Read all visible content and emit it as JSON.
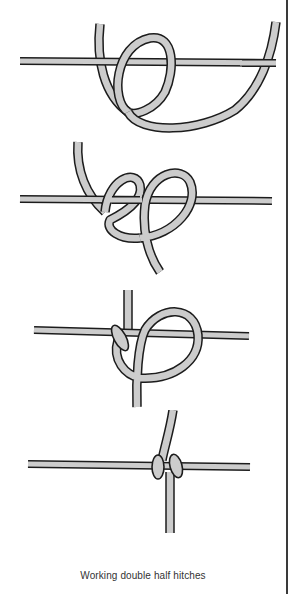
{
  "figure": {
    "caption": "Working double half hitches",
    "stages": [
      {
        "step": 1,
        "description": "Working cord looped over holding cord, first loop formed"
      },
      {
        "step": 2,
        "description": "Two loops formed around holding cord"
      },
      {
        "step": 3,
        "description": "First half hitch tightened, second loop forming"
      },
      {
        "step": 4,
        "description": "Double half hitch completed and tightened"
      }
    ],
    "colors": {
      "rope_fill": "#cccccc",
      "rope_outline": "#1c1c1c",
      "background": "#ffffff",
      "border": "#3a3a3a"
    }
  }
}
